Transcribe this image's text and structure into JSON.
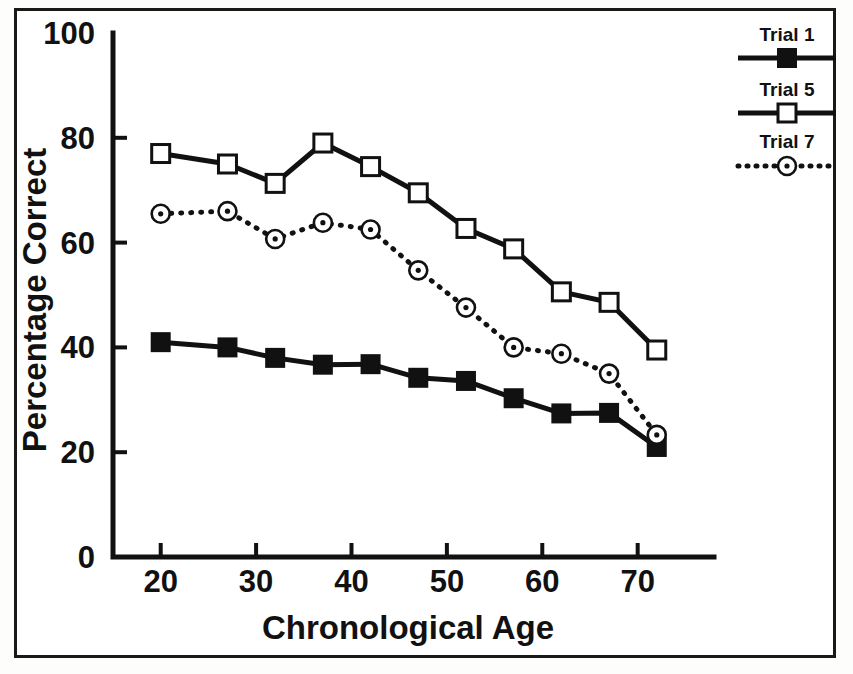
{
  "figure": {
    "frame_color": "#191919",
    "background": "#ffffff"
  },
  "legend": {
    "position": "top-right-outside",
    "entries": [
      {
        "label": "Trial 1",
        "marker": "filled-square",
        "line": "solid"
      },
      {
        "label": "Trial 5",
        "marker": "open-square",
        "line": "solid"
      },
      {
        "label": "Trial 7",
        "marker": "dotted-circle",
        "line": "dotted"
      }
    ]
  },
  "axes": {
    "x": {
      "title": "Chronological Age",
      "ticks": [
        20,
        30,
        40,
        50,
        60,
        70
      ],
      "tick_labels": [
        "20",
        "30",
        "40",
        "50",
        "60",
        "70"
      ],
      "min": 15,
      "max": 78
    },
    "y": {
      "title": "Percentage Correct",
      "ticks": [
        0,
        20,
        40,
        60,
        80,
        100
      ],
      "tick_labels": [
        "0",
        "20",
        "40",
        "60",
        "80",
        "100"
      ],
      "min": 0,
      "max": 100
    }
  },
  "chart_data": {
    "type": "line",
    "title": "",
    "xlabel": "Chronological Age",
    "ylabel": "Percentage Correct",
    "xlim": [
      15,
      78
    ],
    "ylim": [
      0,
      100
    ],
    "grid": false,
    "legend_position": "upper right outside",
    "x": [
      20,
      27,
      32,
      37,
      42,
      47,
      52,
      57,
      62,
      67,
      72
    ],
    "series": [
      {
        "name": "Trial 1",
        "marker": "filled-square",
        "linestyle": "solid",
        "color": "#111111",
        "values": [
          41.0,
          40.0,
          38.0,
          36.7,
          36.8,
          34.2,
          33.6,
          30.3,
          27.4,
          27.5,
          21.0
        ]
      },
      {
        "name": "Trial 5",
        "marker": "open-square",
        "linestyle": "solid",
        "color": "#111111",
        "values": [
          77.0,
          75.0,
          71.3,
          79.0,
          74.5,
          69.5,
          62.7,
          58.8,
          50.6,
          48.6,
          39.5
        ]
      },
      {
        "name": "Trial 7",
        "marker": "dotted-circle",
        "linestyle": "dotted",
        "color": "#111111",
        "values": [
          65.5,
          66.0,
          60.7,
          63.8,
          62.5,
          54.7,
          47.6,
          40.0,
          38.8,
          35.0,
          23.3
        ]
      }
    ]
  }
}
